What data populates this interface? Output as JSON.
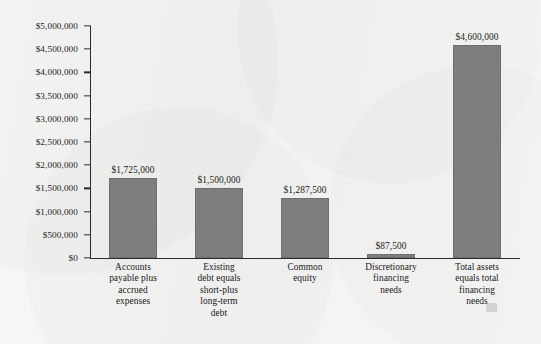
{
  "chart_data": {
    "type": "bar",
    "title": "",
    "subtitle": "",
    "xlabel": "",
    "ylabel": "",
    "ylim": [
      0,
      5000000
    ],
    "ytick_step": 500000,
    "grid": false,
    "legend": null,
    "bar_color": "#7e7e7e",
    "axis_color": "#2b2b2b",
    "background_color": "#f4f4f2",
    "categories": [
      "Accounts payable plus accrued expenses",
      "Existing debt equals short-plus long-term debt",
      "Common equity",
      "Discretionary financing needs",
      "Total assets equals total financing needs"
    ],
    "category_lines": [
      [
        "Accounts",
        "payable plus",
        "accrued",
        "expenses"
      ],
      [
        "Existing",
        "debt equals",
        "short-plus",
        "long-term",
        "debt"
      ],
      [
        "Common",
        "equity"
      ],
      [
        "Discretionary",
        "financing",
        "needs"
      ],
      [
        "Total assets",
        "equals total",
        "financing",
        "needs"
      ]
    ],
    "values": [
      1725000,
      1500000,
      1287500,
      87500,
      4600000
    ],
    "value_labels": [
      "$1,725,000",
      "$1,500,000",
      "$1,287,500",
      "$87,500",
      "$4,600,000"
    ],
    "ytick_values": [
      5000000,
      4500000,
      4000000,
      3500000,
      3000000,
      2500000,
      2000000,
      1500000,
      1000000,
      500000,
      0
    ],
    "ytick_labels": [
      "$5,000,000",
      "$4,500,000",
      "$4,000,000",
      "$3,500,000",
      "$3,000,000",
      "$2,500,000",
      "$2,000,000",
      "$1,500,000",
      "$1,000,000",
      "$500,000",
      "$0"
    ]
  }
}
